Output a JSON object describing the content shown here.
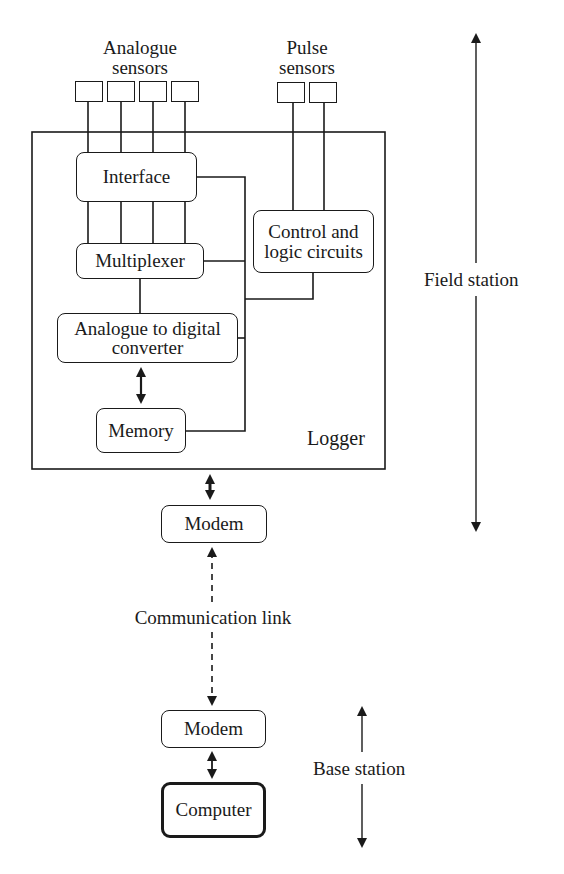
{
  "diagram": {
    "title_groups": {
      "analogue_sensors": "Analogue\nsensors",
      "pulse_sensors": "Pulse\nsensors"
    },
    "sensors": {
      "analogue_count": 4,
      "pulse_count": 2
    },
    "logger": {
      "label": "Logger",
      "blocks": {
        "interface": "Interface",
        "multiplexer": "Multiplexer",
        "adc": "Analogue to digital\nconverter",
        "memory": "Memory",
        "control": "Control and\nlogic circuits"
      }
    },
    "field_modem": "Modem",
    "communication_link": "Communication link",
    "base_modem": "Modem",
    "computer": "Computer",
    "ranges": {
      "field_station": "Field station",
      "base_station": "Base station"
    },
    "colors": {
      "line": "#1a1a1a",
      "background": "#ffffff"
    }
  }
}
